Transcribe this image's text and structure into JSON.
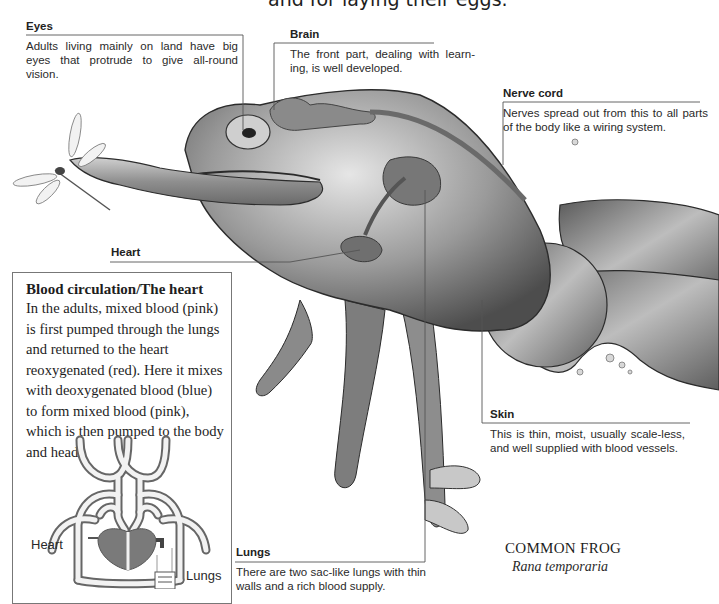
{
  "top_caption": "and for laying their eggs.",
  "labels": {
    "eyes": {
      "title": "Eyes",
      "body": "Adults living mainly on land have big eyes that protrude to give all-round vision."
    },
    "brain": {
      "title": "Brain",
      "body": "The front part, dealing with learn-ing, is well developed."
    },
    "nerve_cord": {
      "title": "Nerve cord",
      "body": "Nerves spread out from this to all parts of the body like a wiring system."
    },
    "heart": {
      "title": "Heart"
    },
    "skin": {
      "title": "Skin",
      "body": "This is thin, moist, usually scale-less, and well supplied with blood vessels."
    },
    "lungs": {
      "title": "Lungs",
      "body": "There are two sac-like lungs with thin walls and a rich blood supply."
    }
  },
  "blood_circulation": {
    "title": "Blood circulation/The heart",
    "body": "In the adults, mixed blood (pink) is first pumped through the lungs and returned to the heart reoxygenated (red). Here it mixes with deoxygenated blood (blue) to form mixed blood (pink), which is then pumped to the body and head.",
    "diagram_labels": {
      "heart": "Heart",
      "lungs": "Lungs"
    }
  },
  "species": {
    "common_name": "COMMON FROG",
    "scientific_name": "Rana temporaria"
  },
  "colors": {
    "frog_dark": "#4a4a4a",
    "frog_mid": "#8c8c8c",
    "frog_light": "#d9d9d9",
    "organ": "#7a7a7a",
    "leader_line": "#555555"
  }
}
